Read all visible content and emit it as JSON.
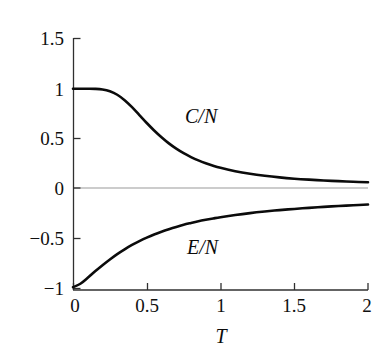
{
  "chart_data": {
    "type": "line",
    "title": "",
    "xlabel": "T",
    "ylabel": "",
    "xlim": [
      0,
      2
    ],
    "ylim": [
      -1,
      1.5
    ],
    "grid": false,
    "legend": "inline-annotations",
    "xticks": [
      "0",
      "0.5",
      "1",
      "1.5",
      "2"
    ],
    "xtick_values": [
      0,
      0.5,
      1,
      1.5,
      2
    ],
    "yticks": [
      "1.5",
      "1",
      "0.5",
      "0",
      "−0.5",
      "−1"
    ],
    "ytick_values": [
      1.5,
      1,
      0.5,
      0,
      -0.5,
      -1
    ],
    "zero_line": true,
    "annotations": [
      {
        "text": "C/N",
        "x": 0.78,
        "y": 0.72
      },
      {
        "text": "E/N",
        "x": 0.8,
        "y": -0.52
      }
    ],
    "series": [
      {
        "name": "C/N",
        "color": "#0b0b0b",
        "x": [
          0.0,
          0.05,
          0.1,
          0.15,
          0.2,
          0.25,
          0.3,
          0.35,
          0.4,
          0.45,
          0.5,
          0.55,
          0.6,
          0.65,
          0.7,
          0.75,
          0.8,
          0.85,
          0.9,
          0.95,
          1.0,
          1.1,
          1.2,
          1.3,
          1.4,
          1.5,
          1.6,
          1.7,
          1.8,
          1.9,
          2.0
        ],
        "values": [
          1.0,
          1.0,
          1.0,
          0.999,
          0.993,
          0.975,
          0.94,
          0.885,
          0.815,
          0.735,
          0.655,
          0.58,
          0.512,
          0.45,
          0.397,
          0.351,
          0.312,
          0.278,
          0.249,
          0.224,
          0.203,
          0.169,
          0.143,
          0.123,
          0.107,
          0.094,
          0.084,
          0.076,
          0.069,
          0.063,
          0.058
        ]
      },
      {
        "name": "E/N",
        "color": "#0b0b0b",
        "x": [
          0.0,
          0.05,
          0.1,
          0.15,
          0.2,
          0.25,
          0.3,
          0.35,
          0.4,
          0.45,
          0.5,
          0.55,
          0.6,
          0.65,
          0.7,
          0.75,
          0.8,
          0.85,
          0.9,
          0.95,
          1.0,
          1.1,
          1.2,
          1.3,
          1.4,
          1.5,
          1.6,
          1.7,
          1.8,
          1.9,
          2.0
        ],
        "values": [
          -1.0,
          -0.965,
          -0.905,
          -0.84,
          -0.778,
          -0.72,
          -0.666,
          -0.618,
          -0.574,
          -0.535,
          -0.5,
          -0.468,
          -0.44,
          -0.415,
          -0.392,
          -0.371,
          -0.353,
          -0.336,
          -0.321,
          -0.307,
          -0.294,
          -0.272,
          -0.253,
          -0.237,
          -0.223,
          -0.211,
          -0.2,
          -0.19,
          -0.182,
          -0.174,
          -0.167
        ]
      }
    ]
  },
  "axes": {
    "x_title": "T",
    "y_tick_labels": [
      "1.5",
      "1",
      "0.5",
      "0",
      "−0.5",
      "−1"
    ],
    "x_tick_labels": [
      "0",
      "0.5",
      "1",
      "1.5",
      "2"
    ]
  },
  "labels": {
    "heat_capacity": "C/N",
    "energy": "E/N"
  },
  "colors": {
    "background": "#ffffff",
    "axis": "#303030",
    "curve": "#0b0b0b",
    "zero_line": "#9a9a9a",
    "text": "#101010"
  }
}
